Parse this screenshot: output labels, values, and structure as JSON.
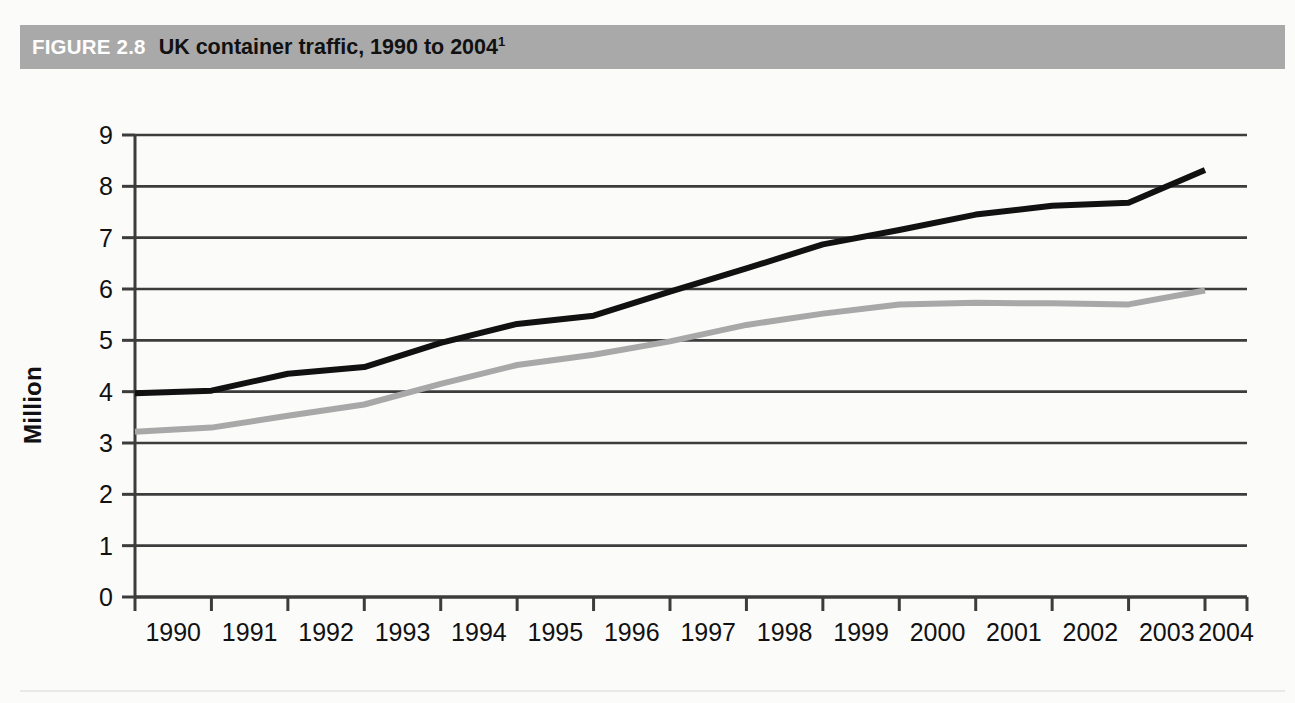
{
  "figure": {
    "number_label": "FIGURE 2.8",
    "title": "UK container traffic, 1990 to 2004",
    "title_superscript": "1",
    "header_bg": "#a9a9a9",
    "page_bg": "#fbfbfa"
  },
  "chart_data": {
    "type": "line",
    "title": "UK container traffic, 1990 to 2004",
    "xlabel": "",
    "ylabel": "Million",
    "categories": [
      "1990",
      "1991",
      "1992",
      "1993",
      "1994",
      "1995",
      "1996",
      "1997",
      "1998",
      "1999",
      "2000",
      "2001",
      "2002",
      "2003",
      "2004"
    ],
    "x": [
      1990,
      1991,
      1992,
      1993,
      1994,
      1995,
      1996,
      1997,
      1998,
      1999,
      2000,
      2001,
      2002,
      2003,
      2004
    ],
    "ylim": [
      0,
      9
    ],
    "xlim": [
      1990,
      2004
    ],
    "y_ticks": [
      0,
      1,
      2,
      3,
      4,
      5,
      6,
      7,
      8,
      9
    ],
    "y_tick_labels": [
      "0",
      "1",
      "2",
      "3",
      "4",
      "5",
      "6",
      "7",
      "8",
      "9"
    ],
    "grid": true,
    "grid_axis": "y",
    "grid_color": "#3c3c3c",
    "legend": false,
    "legend_position": "none",
    "series": [
      {
        "name": "Total container traffic",
        "color": "#111111",
        "line_width": 6,
        "values": [
          3.97,
          4.02,
          4.35,
          4.48,
          4.95,
          5.32,
          5.48,
          5.95,
          6.4,
          6.87,
          7.15,
          7.45,
          7.62,
          7.68,
          8.32
        ]
      },
      {
        "name": "Deep-sea container traffic",
        "color": "#a8a8a8",
        "line_width": 6,
        "values": [
          3.22,
          3.3,
          3.53,
          3.75,
          4.15,
          4.52,
          4.72,
          4.98,
          5.3,
          5.52,
          5.7,
          5.73,
          5.72,
          5.7,
          5.97
        ]
      }
    ]
  },
  "axis": {
    "y_title": "Million",
    "y_tick_labels": [
      "0",
      "1",
      "2",
      "3",
      "4",
      "5",
      "6",
      "7",
      "8",
      "9"
    ],
    "x_tick_labels": [
      "1990",
      "1991",
      "1992",
      "1993",
      "1994",
      "1995",
      "1996",
      "1997",
      "1998",
      "1999",
      "2000",
      "2001",
      "2002",
      "2003",
      "2004"
    ]
  }
}
